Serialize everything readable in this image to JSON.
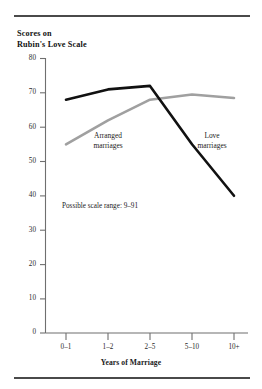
{
  "figure": {
    "title": "Scores on\nRubin's Love Scale",
    "note": "Possible scale range: 9–91",
    "rule_color": "#4a4a4a"
  },
  "chart_data": {
    "type": "line",
    "title": "Scores on Rubin's Love Scale",
    "xlabel": "Years of Marriage",
    "ylabel": "Scores on Rubin's Love Scale",
    "categories": [
      "0–1",
      "1–2",
      "2–5",
      "5–10",
      "10+"
    ],
    "ylim": [
      0,
      80
    ],
    "yticks": [
      0,
      10,
      20,
      30,
      40,
      50,
      60,
      70,
      80
    ],
    "grid": false,
    "legend_position": "inline-annotations",
    "annotations": [
      "Possible scale range: 9–91"
    ],
    "series": [
      {
        "name": "Love marriages",
        "color": "#111111",
        "values": [
          68,
          71,
          72,
          55,
          40
        ]
      },
      {
        "name": "Arranged marriages",
        "color": "#a0a0a0",
        "values": [
          55,
          62,
          68,
          69.5,
          68.5
        ]
      }
    ]
  },
  "axis": {
    "y_ticks": [
      "80",
      "70",
      "60",
      "50",
      "40",
      "30",
      "20",
      "10",
      "0"
    ],
    "x_ticks": [
      "0–1",
      "1–2",
      "2–5",
      "5–10",
      "10+"
    ],
    "x_title": "Years of Marriage"
  },
  "labels": {
    "arranged": "Arranged\nmarriages",
    "love": "Love\nmarriages"
  }
}
